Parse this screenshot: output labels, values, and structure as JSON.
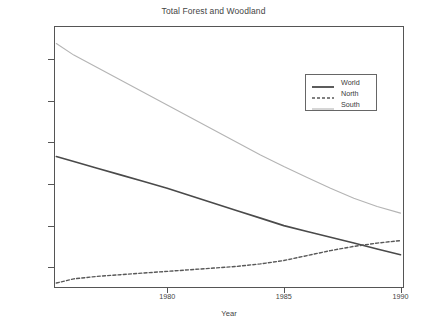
{
  "chart_data": {
    "type": "line",
    "title": "Total Forest and Woodland",
    "xlabel": "Year",
    "ylabel": "Forest and Woodland Area (% of total area)",
    "xlim": [
      1975.15,
      1990.15
    ],
    "ylim": [
      26.25,
      29.4
    ],
    "xticks": [
      1980,
      1985,
      1990
    ],
    "xticklabels": [
      "1980",
      "1985",
      "1990"
    ],
    "yticks": [
      26.5,
      27.0,
      27.5,
      28.0,
      28.5,
      29.0
    ],
    "yticklabels": [
      "26.5",
      "27.0",
      "27.5",
      "28.0",
      "28.5",
      "29.0"
    ],
    "grid": false,
    "legend_position": "upper right",
    "x": [
      1975.25,
      1976,
      1977,
      1978,
      1979,
      1980,
      1981,
      1982,
      1983,
      1984,
      1985,
      1986,
      1987,
      1988,
      1989,
      1990
    ],
    "series": [
      {
        "name": "World",
        "style": "solid",
        "color": "#4a4a4a",
        "width": 1.6,
        "values": [
          27.83,
          27.77,
          27.69,
          27.61,
          27.53,
          27.45,
          27.36,
          27.27,
          27.18,
          27.09,
          27.0,
          26.93,
          26.86,
          26.79,
          26.72,
          26.65
        ]
      },
      {
        "name": "North",
        "style": "dashed",
        "color": "#585858",
        "width": 1.4,
        "values": [
          26.31,
          26.36,
          26.39,
          26.41,
          26.43,
          26.45,
          26.47,
          26.49,
          26.51,
          26.54,
          26.58,
          26.64,
          26.7,
          26.75,
          26.79,
          26.82
        ]
      },
      {
        "name": "South",
        "style": "solid",
        "color": "#b4b4b4",
        "width": 1.1,
        "values": [
          29.19,
          29.05,
          28.9,
          28.75,
          28.6,
          28.45,
          28.3,
          28.15,
          28.0,
          27.85,
          27.71,
          27.58,
          27.45,
          27.33,
          27.23,
          27.15
        ]
      }
    ]
  },
  "legend": {
    "items": [
      {
        "label": "World"
      },
      {
        "label": "North"
      },
      {
        "label": "South"
      }
    ]
  },
  "axes": {
    "y_tick_labels": [
      "29.0",
      "28.5",
      "28.0",
      "27.5",
      "27.0",
      "26.5"
    ],
    "x_tick_labels": [
      "1980",
      "1985",
      "1990"
    ]
  }
}
